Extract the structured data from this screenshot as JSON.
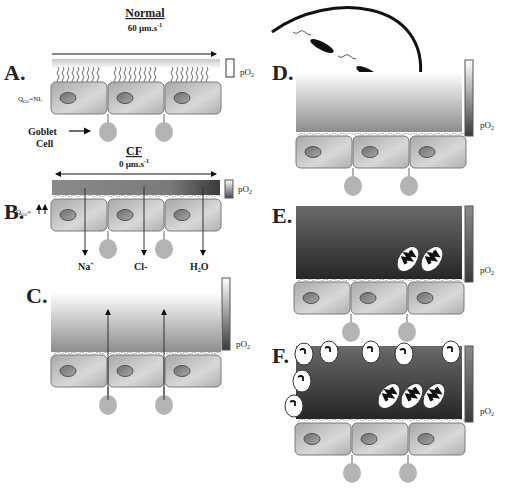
{
  "figure": {
    "panels": [
      {
        "id": "A",
        "label": "A.",
        "title": "Normal",
        "velocity": "60 µm.s",
        "velocity_exp": "-1",
        "qo2": "Q",
        "qo2_sub": "O2",
        "qo2_value": "=NL",
        "scale_label": "pO",
        "scale_sub": "2",
        "annotation": "Goblet",
        "annotation2": "Cell"
      },
      {
        "id": "B",
        "label": "B.",
        "title": "CF",
        "velocity": "0 µm.s",
        "velocity_exp": "-1",
        "qo2": "Q",
        "qo2_sub": "O2",
        "qo2_value": "=",
        "scale_label": "pO",
        "scale_sub": "2",
        "ions": [
          "Na+",
          "Cl-",
          "H2O"
        ]
      },
      {
        "id": "C",
        "label": "C.",
        "scale_label": "pO",
        "scale_sub": "2"
      },
      {
        "id": "D",
        "label": "D.",
        "scale_label": "pO",
        "scale_sub": "2"
      },
      {
        "id": "E",
        "label": "E.",
        "scale_label": "pO",
        "scale_sub": "2"
      },
      {
        "id": "F",
        "label": "F.",
        "scale_label": "pO",
        "scale_sub": "2"
      }
    ],
    "colors": {
      "cell_fill": "#b8b8b8",
      "cell_stroke": "#777777",
      "nucleus": "#8a8a8a",
      "goblet": "#b0b0b0",
      "bacteria": "#111111",
      "dark_mucus": "#4a4a4a"
    }
  }
}
